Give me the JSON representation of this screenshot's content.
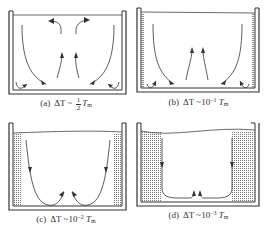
{
  "figure": {
    "panels": [
      {
        "id": "a",
        "label": "(a)",
        "expression_prefix": "ΔT ~ ",
        "fraction": {
          "numerator": "1",
          "denominator": "2"
        },
        "expression_base": "T",
        "subscript": "m",
        "exponent": "",
        "description": "Strong convection: rising plumes in center and descending flows near walls, with small wall eddies"
      },
      {
        "id": "b",
        "label": "(b)",
        "expression_prefix": "ΔT ~10",
        "exponent": "−1",
        "expression_base": "T",
        "subscript": "m",
        "description": "Thin stratified layers along walls; rising central plumes and descending wall flows"
      },
      {
        "id": "c",
        "label": "(c)",
        "expression_prefix": "ΔT ~10",
        "exponent": "−2",
        "expression_base": "T",
        "subscript": "m",
        "description": "Thicker dotted boundary layers at walls; two U-shaped circulation loops meeting at center bottom"
      },
      {
        "id": "d",
        "label": "(d)",
        "expression_prefix": "ΔT ~10",
        "exponent": "−3",
        "expression_base": "T",
        "subscript": "m",
        "description": "Thick dotted layers at walls; flat-bottomed loops descending along layer edges and turning up at center"
      }
    ]
  }
}
